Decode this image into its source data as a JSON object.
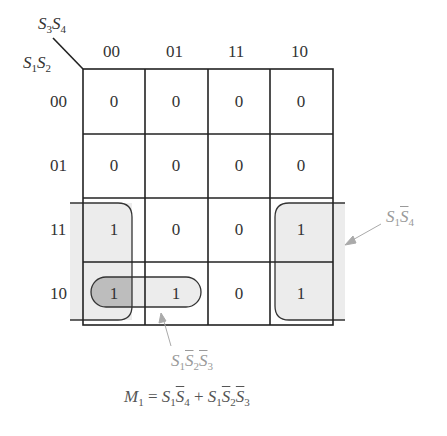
{
  "kmap": {
    "row_var_label": {
      "v1": "S",
      "s1": "1",
      "v2": "S",
      "s2": "2"
    },
    "col_var_label": {
      "v1": "S",
      "s1": "3",
      "v2": "S",
      "s2": "4"
    },
    "col_headers": [
      "00",
      "01",
      "11",
      "10"
    ],
    "row_headers": [
      "00",
      "01",
      "11",
      "10"
    ],
    "cells": [
      [
        "0",
        "0",
        "0",
        "0"
      ],
      [
        "0",
        "0",
        "0",
        "0"
      ],
      [
        "1",
        "0",
        "0",
        "1"
      ],
      [
        "1",
        "1",
        "0",
        "1"
      ]
    ]
  },
  "groups": [
    {
      "name": "S1 S4-bar",
      "label_parts": {
        "a": "S",
        "a_sub": "1",
        "b": "S",
        "b_sub": "4"
      },
      "cells": "rows 11,10 × cols 00,10 (wrap-around)"
    },
    {
      "name": "S1 S2-bar S3-bar",
      "label_parts": {
        "a": "S",
        "a_sub": "1",
        "b": "S",
        "b_sub": "2",
        "c": "S",
        "c_sub": "3"
      },
      "cells": "row 10 × cols 00,01"
    }
  ],
  "equation": {
    "lhs": "M",
    "lhs_sub": "1",
    "eq": "=",
    "t1a": "S",
    "t1a_sub": "1",
    "t1b": "S",
    "t1b_sub": "4",
    "plus": "+",
    "t2a": "S",
    "t2a_sub": "1",
    "t2b": "S",
    "t2b_sub": "2",
    "t2c": "S",
    "t2c_sub": "3"
  }
}
